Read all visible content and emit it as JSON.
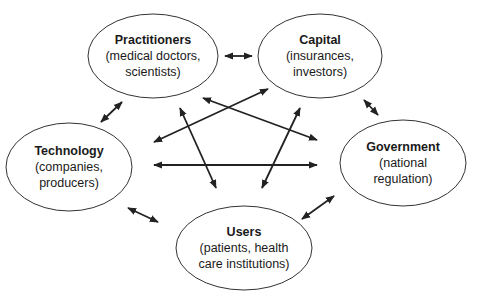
{
  "diagram": {
    "type": "relationship-network",
    "nodes": [
      {
        "id": "practitioners",
        "title": "Practitioners",
        "line1": "(medical doctors,",
        "line2": "scientists)",
        "cx": 153,
        "cy": 56,
        "rx": 65,
        "ry": 42
      },
      {
        "id": "capital",
        "title": "Capital",
        "line1": "(insurances,",
        "line2": "investors)",
        "cx": 320,
        "cy": 56,
        "rx": 62,
        "ry": 42
      },
      {
        "id": "technology",
        "title": "Technology",
        "line1": "(companies,",
        "line2": "producers)",
        "cx": 69,
        "cy": 167,
        "rx": 63,
        "ry": 44
      },
      {
        "id": "government",
        "title": "Government",
        "line1": "(national",
        "line2": "regulation)",
        "cx": 403,
        "cy": 163,
        "rx": 63,
        "ry": 43
      },
      {
        "id": "users",
        "title": "Users",
        "line1": "(patients, health",
        "line2": "care institutions)",
        "cx": 244,
        "cy": 248,
        "rx": 68,
        "ry": 42
      }
    ],
    "edges": [
      {
        "from": "practitioners",
        "to": "capital",
        "x1": 225,
        "y1": 56,
        "x2": 252,
        "y2": 56
      },
      {
        "from": "practitioners",
        "to": "technology",
        "x1": 122,
        "y1": 102,
        "x2": 101,
        "y2": 122
      },
      {
        "from": "capital",
        "to": "government",
        "x1": 364,
        "y1": 100,
        "x2": 378,
        "y2": 115
      },
      {
        "from": "technology",
        "to": "users",
        "x1": 128,
        "y1": 208,
        "x2": 158,
        "y2": 222
      },
      {
        "from": "users",
        "to": "government",
        "x1": 302,
        "y1": 219,
        "x2": 334,
        "y2": 196
      },
      {
        "from": "technology",
        "to": "capital",
        "x1": 154,
        "y1": 142,
        "x2": 268,
        "y2": 89
      },
      {
        "from": "practitioners",
        "to": "government",
        "x1": 203,
        "y1": 98,
        "x2": 317,
        "y2": 140
      },
      {
        "from": "practitioners",
        "to": "users",
        "x1": 180,
        "y1": 108,
        "x2": 216,
        "y2": 188
      },
      {
        "from": "capital",
        "to": "users",
        "x1": 300,
        "y1": 108,
        "x2": 262,
        "y2": 188
      },
      {
        "from": "technology",
        "to": "government",
        "x1": 154,
        "y1": 165,
        "x2": 317,
        "y2": 165
      }
    ],
    "colors": {
      "stroke": "#333333",
      "arrow": "#222222",
      "text": "#1a1a1a",
      "background": "#ffffff"
    }
  }
}
